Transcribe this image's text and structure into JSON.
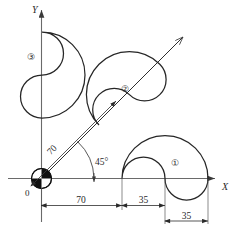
{
  "drawing": {
    "title": "Cam profile positioning diagram",
    "axes": {
      "x_label": "X",
      "y_label": "Y",
      "origin_label": "0",
      "origin_marker": "quartered-circle-origin-symbol"
    },
    "shapes": [
      {
        "id": "shape-1",
        "label": "①",
        "marker_text": "1",
        "placement": "on X axis at x=70"
      },
      {
        "id": "shape-2",
        "label": "②",
        "marker_text": "2",
        "placement": "on 45 degree ray at distance 70"
      },
      {
        "id": "shape-3",
        "label": "③",
        "marker_text": "3",
        "placement": "on Y axis"
      }
    ],
    "dimensions": [
      {
        "name": "dim-70-x",
        "value": "70",
        "axis": "x",
        "from": "origin",
        "to": "shape-1 start"
      },
      {
        "name": "dim-35-x",
        "value": "35",
        "axis": "x",
        "from": "shape-1 start",
        "to": "shape-1 notch"
      },
      {
        "name": "dim-35-lower",
        "value": "35",
        "axis": "x",
        "from": "shape-1 notch",
        "to": "shape-1 right"
      },
      {
        "name": "dim-70-ray",
        "value": "70",
        "axis": "45-degree-ray",
        "from": "origin",
        "to": "shape-2 base"
      }
    ],
    "angle": {
      "name": "angle-45",
      "value": "45°"
    },
    "colors": {
      "line": "#262626",
      "axis": "#555555",
      "background": "#ffffff",
      "marker_fill": "#111111"
    }
  }
}
